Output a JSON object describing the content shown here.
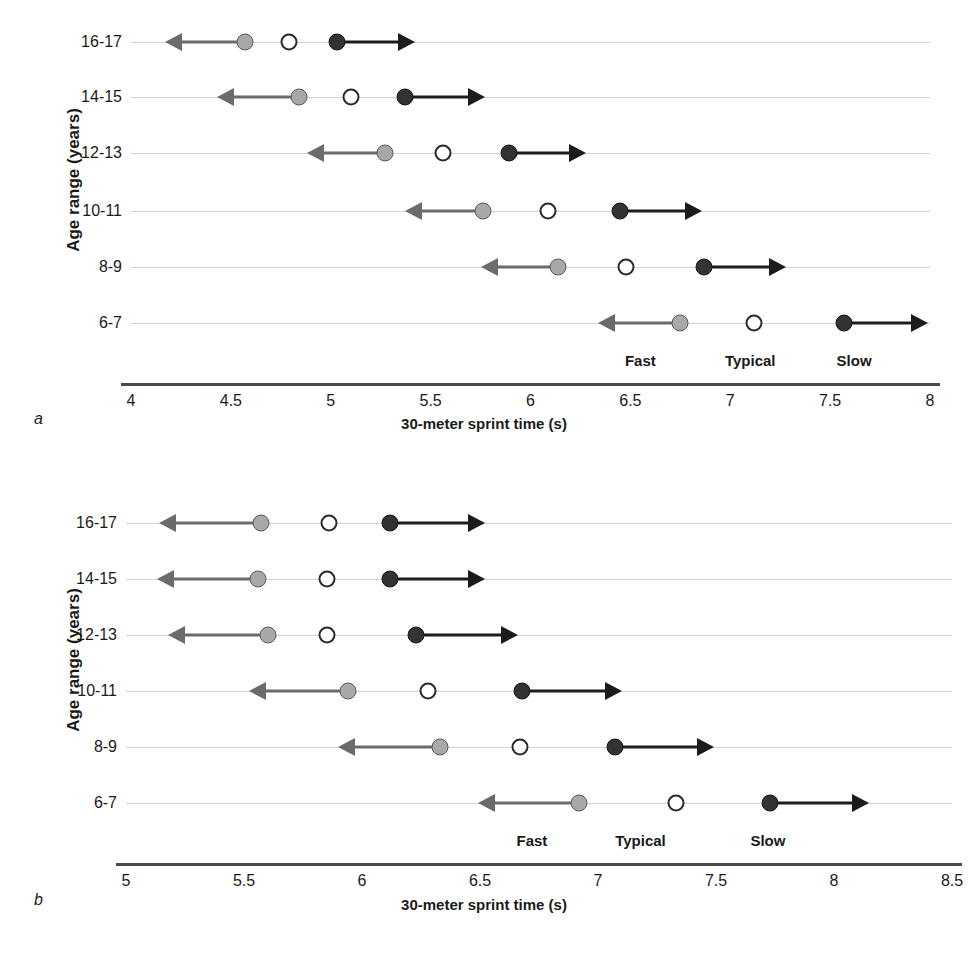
{
  "figure": {
    "panels": [
      {
        "letter": "a",
        "y_axis_title": "Age range (years)",
        "x_axis_title": "30-meter sprint time (s)",
        "categories": [
          "16-17",
          "14-15",
          "12-13",
          "10-11",
          "8-9",
          "6-7"
        ],
        "xticks": [
          "4",
          "4.5",
          "5",
          "5.5",
          "6",
          "6.5",
          "7",
          "7.5",
          "8"
        ],
        "xtick_values": [
          4,
          4.5,
          5,
          5.5,
          6,
          6.5,
          7,
          7.5,
          8
        ],
        "xlim": [
          4,
          8
        ],
        "band_labels": [
          "Fast",
          "Typical",
          "Slow"
        ],
        "band_label_positions": [
          6.55,
          7.1,
          7.62
        ]
      },
      {
        "letter": "b",
        "y_axis_title": "Age range (years)",
        "x_axis_title": "30-meter sprint time (s)",
        "categories": [
          "16-17",
          "14-15",
          "12-13",
          "10-11",
          "8-9",
          "6-7"
        ],
        "xticks": [
          "5",
          "5.5",
          "6",
          "6.5",
          "7",
          "7.5",
          "8",
          "8.5"
        ],
        "xtick_values": [
          5,
          5.5,
          6,
          6.5,
          7,
          7.5,
          8,
          8.5
        ],
        "xlim": [
          5,
          8.5
        ],
        "band_labels": [
          "Fast",
          "Typical",
          "Slow"
        ],
        "band_label_positions": [
          6.72,
          7.18,
          7.72
        ]
      }
    ]
  },
  "colors": {
    "fast_marker": "#a8a8a8",
    "typical_marker": "#ffffff",
    "slow_marker": "#333333",
    "fast_arrow": "#6b6b6b",
    "slow_arrow": "#1c1c1c",
    "rowline": "#d2d2d2",
    "axis": "#4a4a4a"
  },
  "chart_data": {
    "type": "scatter",
    "title": "",
    "xlabel": "30-meter sprint time (s)",
    "ylabel": "Age range (years)",
    "grid": false,
    "legend": "inline-band-labels",
    "panels": [
      {
        "id": "a",
        "xlim": [
          4,
          8
        ],
        "categories": [
          "16-17",
          "14-15",
          "12-13",
          "10-11",
          "8-9",
          "6-7"
        ],
        "series": [
          {
            "name": "Fast",
            "values": [
              4.57,
              4.84,
              5.27,
              5.76,
              6.14,
              6.75
            ],
            "marker": "filled-gray",
            "arrow": "left"
          },
          {
            "name": "Typical",
            "values": [
              4.79,
              5.1,
              5.56,
              6.09,
              6.48,
              7.12
            ],
            "marker": "open",
            "arrow": "none"
          },
          {
            "name": "Slow",
            "values": [
              5.03,
              5.37,
              5.89,
              6.45,
              6.87,
              7.57
            ],
            "marker": "filled-black",
            "arrow": "right"
          }
        ],
        "arrow_extent": [
          {
            "category": "16-17",
            "fast_arrow_to": 4.17,
            "slow_arrow_to": 5.42
          },
          {
            "category": "14-15",
            "fast_arrow_to": 4.43,
            "slow_arrow_to": 5.77
          },
          {
            "category": "12-13",
            "fast_arrow_to": 4.88,
            "slow_arrow_to": 6.28
          },
          {
            "category": "10-11",
            "fast_arrow_to": 5.37,
            "slow_arrow_to": 6.86
          },
          {
            "category": "8-9",
            "fast_arrow_to": 5.75,
            "slow_arrow_to": 7.28
          },
          {
            "category": "6-7",
            "fast_arrow_to": 6.34,
            "slow_arrow_to": 7.99
          }
        ]
      },
      {
        "id": "b",
        "xlim": [
          5,
          8.5
        ],
        "categories": [
          "16-17",
          "14-15",
          "12-13",
          "10-11",
          "8-9",
          "6-7"
        ],
        "series": [
          {
            "name": "Fast",
            "values": [
              5.57,
              5.56,
              5.6,
              5.94,
              6.33,
              6.92
            ],
            "marker": "filled-gray",
            "arrow": "left"
          },
          {
            "name": "Typical",
            "values": [
              5.86,
              5.85,
              5.85,
              6.28,
              6.67,
              7.33
            ],
            "marker": "open",
            "arrow": "none"
          },
          {
            "name": "Slow",
            "values": [
              6.12,
              6.12,
              6.23,
              6.68,
              7.07,
              7.73
            ],
            "marker": "filled-black",
            "arrow": "right"
          }
        ],
        "arrow_extent": [
          {
            "category": "16-17",
            "fast_arrow_to": 5.14,
            "slow_arrow_to": 6.52
          },
          {
            "category": "14-15",
            "fast_arrow_to": 5.13,
            "slow_arrow_to": 6.52
          },
          {
            "category": "12-13",
            "fast_arrow_to": 5.18,
            "slow_arrow_to": 6.66
          },
          {
            "category": "10-11",
            "fast_arrow_to": 5.52,
            "slow_arrow_to": 7.1
          },
          {
            "category": "8-9",
            "fast_arrow_to": 5.9,
            "slow_arrow_to": 7.49
          },
          {
            "category": "6-7",
            "fast_arrow_to": 6.49,
            "slow_arrow_to": 8.15
          }
        ]
      }
    ]
  }
}
